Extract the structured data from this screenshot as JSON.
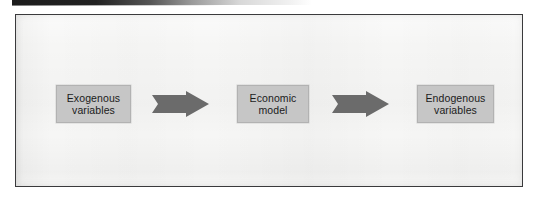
{
  "figure": {
    "type": "process-flow-diagram",
    "caption": "",
    "background_color": "#f6f6f5",
    "frame_color": "#3a3a3c",
    "box_fill_color": "#c6c6c6",
    "arrow_color": "#6b6b6b",
    "text_color": "#1b1b1b",
    "nodes": [
      {
        "id": "exogenous",
        "label": "Exogenous\nvariables"
      },
      {
        "id": "model",
        "label": "Economic\nmodel"
      },
      {
        "id": "endogenous",
        "label": "Endogenous\nvariables"
      }
    ],
    "arrows": [
      {
        "id": "arrow-1",
        "from": "exogenous",
        "to": "model",
        "direction": "right"
      },
      {
        "id": "arrow-2",
        "from": "model",
        "to": "endogenous",
        "direction": "right"
      }
    ]
  }
}
